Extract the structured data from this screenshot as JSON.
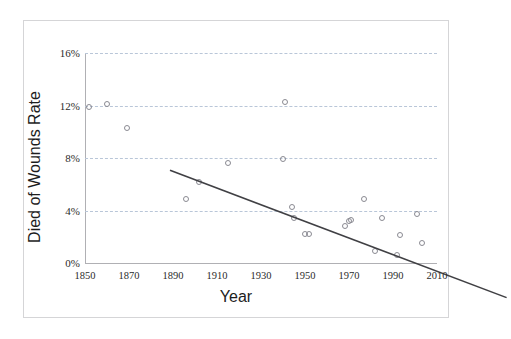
{
  "chart_data": {
    "type": "scatter",
    "title": "",
    "xlabel": "Year",
    "ylabel": "Died of Wounds Rate",
    "xlim": [
      1850,
      2010
    ],
    "ylim": [
      0,
      16
    ],
    "grid": true,
    "legend": null,
    "x_ticks": [
      "1850",
      "1870",
      "1890",
      "1910",
      "1930",
      "1950",
      "1970",
      "1990",
      "2010"
    ],
    "x_tick_values": [
      1850,
      1870,
      1890,
      1910,
      1930,
      1950,
      1970,
      1990,
      2010
    ],
    "y_ticks": [
      "0%",
      "4%",
      "8%",
      "12%",
      "16%"
    ],
    "y_tick_values": [
      0,
      4,
      8,
      12,
      16
    ],
    "points": [
      {
        "x": 1852,
        "y": 11.9
      },
      {
        "x": 1860,
        "y": 12.1
      },
      {
        "x": 1869,
        "y": 10.3
      },
      {
        "x": 1896,
        "y": 4.9
      },
      {
        "x": 1902,
        "y": 6.2
      },
      {
        "x": 1915,
        "y": 7.6
      },
      {
        "x": 1940,
        "y": 7.9
      },
      {
        "x": 1941,
        "y": 12.3
      },
      {
        "x": 1944,
        "y": 4.3
      },
      {
        "x": 1945,
        "y": 3.4
      },
      {
        "x": 1950,
        "y": 2.2
      },
      {
        "x": 1952,
        "y": 2.2
      },
      {
        "x": 1968,
        "y": 2.8
      },
      {
        "x": 1970,
        "y": 3.2
      },
      {
        "x": 1971,
        "y": 3.3
      },
      {
        "x": 1977,
        "y": 4.9
      },
      {
        "x": 1982,
        "y": 0.9
      },
      {
        "x": 1985,
        "y": 3.4
      },
      {
        "x": 1992,
        "y": 0.6
      },
      {
        "x": 1993,
        "y": 2.1
      },
      {
        "x": 2001,
        "y": 3.7
      },
      {
        "x": 2003,
        "y": 1.5
      }
    ],
    "trendline": {
      "x_start": 1850,
      "y_start": 11.1,
      "x_end": 2003,
      "y_end": 1.4,
      "color": "#404044"
    },
    "marker_color": "#8a8a92",
    "gridline_color": "#b9c6d8",
    "axis_color": "#b0b0b4",
    "background": "#ffffff"
  }
}
